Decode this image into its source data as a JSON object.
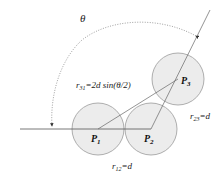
{
  "diagram": {
    "angle_label": "θ",
    "points": [
      {
        "id": "P1",
        "label": "P",
        "sub": "1",
        "cx": 98,
        "cy": 129
      },
      {
        "id": "P2",
        "label": "P",
        "sub": "2",
        "cx": 151,
        "cy": 129
      },
      {
        "id": "P3",
        "label": "P",
        "sub": "3",
        "cx": 178,
        "cy": 79
      }
    ],
    "circle_radius": 26,
    "distances": {
      "r31": {
        "var": "r",
        "sub": "31",
        "expr": "=2d sin(θ/2)"
      },
      "r23": {
        "var": "r",
        "sub": "23",
        "expr": "=d"
      },
      "r12": {
        "var": "r",
        "sub": "12",
        "expr": "=d"
      }
    },
    "colors": {
      "circle_fill": "#ececec",
      "circle_stroke": "#9a9a9a",
      "line": "#555555"
    }
  }
}
